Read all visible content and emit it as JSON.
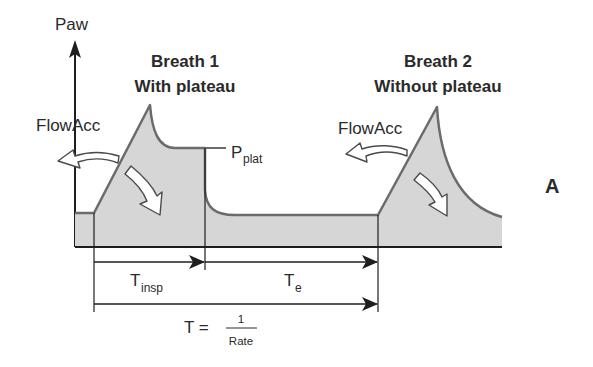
{
  "figure": {
    "panel_label": "A",
    "y_axis_label": "Paw",
    "breath1": {
      "title_line1": "Breath 1",
      "title_line2": "With plateau",
      "flow_label": "FlowAcc",
      "plateau_label_main": "P",
      "plateau_label_sub": "plat"
    },
    "breath2": {
      "title_line1": "Breath 2",
      "title_line2": "Without plateau",
      "flow_label": "FlowAcc"
    },
    "timing": {
      "tinsp_main": "T",
      "tinsp_sub": "insp",
      "te_main": "T",
      "te_sub": "e",
      "period_main": "T =",
      "period_numerator": "1",
      "period_denominator": "Rate"
    }
  },
  "colors": {
    "fill": "#d6d6d6",
    "curve": "#6b6b6b",
    "ink": "#1e1e1e"
  }
}
